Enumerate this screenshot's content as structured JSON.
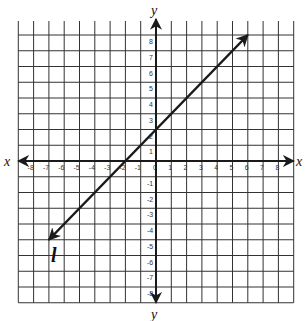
{
  "chart_data": {
    "type": "line",
    "title": "",
    "xlabel": "x",
    "ylabel": "y",
    "xlim": [
      -9,
      9
    ],
    "ylim": [
      -9,
      8
    ],
    "grid": true,
    "x_ticks": [
      -8,
      -7,
      -6,
      -5,
      -4,
      -3,
      -2,
      -1,
      0,
      1,
      2,
      3,
      4,
      5,
      6,
      7,
      8
    ],
    "y_ticks": [
      8,
      7,
      6,
      5,
      4,
      3,
      2,
      1,
      -1,
      -2,
      -3,
      -4,
      -5,
      -6,
      -7,
      -8
    ],
    "series": [
      {
        "name": "l",
        "equation": "y = x + 2",
        "slope": 1,
        "y_intercept": 2,
        "x_intercept": -2,
        "points": [
          [
            -7,
            -5
          ],
          [
            -2,
            0
          ],
          [
            0,
            2
          ],
          [
            6,
            8
          ]
        ],
        "arrows_both_ends": true
      }
    ]
  },
  "labels": {
    "x_axis_left": "x",
    "x_axis_right": "x",
    "y_axis_top": "y",
    "y_axis_bottom": "y",
    "line_label": "l"
  },
  "colors": {
    "grid": "#333333",
    "axis": "#1a1a1a",
    "line": "#1a1a1a",
    "background": "#ffffff"
  }
}
